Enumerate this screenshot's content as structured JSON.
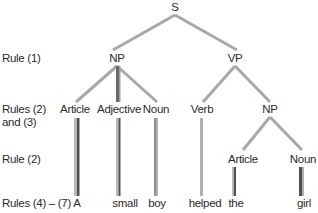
{
  "diagram": {
    "type": "parse-tree",
    "root": "S",
    "level1": [
      {
        "label": "NP"
      },
      {
        "label": "VP"
      }
    ],
    "level2": [
      {
        "label": "Article"
      },
      {
        "label": "Adjective"
      },
      {
        "label": "Noun"
      },
      {
        "label": "Verb"
      },
      {
        "label": "NP"
      }
    ],
    "level3": [
      {
        "label": "Article"
      },
      {
        "label": "Noun"
      }
    ],
    "leaves": [
      {
        "word": "A"
      },
      {
        "word": "small"
      },
      {
        "word": "boy"
      },
      {
        "word": "helped"
      },
      {
        "word": "the"
      },
      {
        "word": "girl"
      }
    ],
    "rules": {
      "row1": "Rule (1)",
      "row2_line1": "Rules (2)",
      "row2_line2": "and (3)",
      "row3": "Rule (2)",
      "row4": "Rules (4) – (7)"
    },
    "colors": {
      "branch": "#a8a8a8",
      "stem_light": "#b4b4b4",
      "stem_dark": "#555555",
      "text": "#2a2a2a"
    }
  }
}
